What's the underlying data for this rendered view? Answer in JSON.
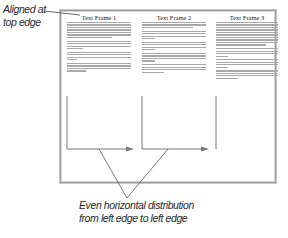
{
  "annotations": {
    "top_label_line1": "Aligned at",
    "top_label_line2": "top edge",
    "bottom_label_line1": "Even horizontal distribution",
    "bottom_label_line2": "from left edge to left edge"
  },
  "frames": [
    {
      "title": "Text Frame 1"
    },
    {
      "title": "Text Frame 2"
    },
    {
      "title": "Text Frame 3"
    }
  ],
  "colors": {
    "line": "#777777",
    "text_placeholder": "#a8a8a8",
    "border": "#9a9a9a"
  }
}
